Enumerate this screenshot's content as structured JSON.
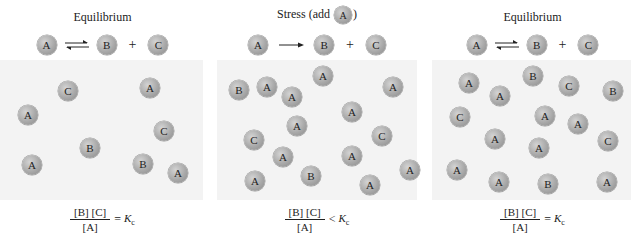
{
  "panels": [
    {
      "title": "Equilibrium",
      "reaction": {
        "reactant": "A",
        "arrow": "equilibrium",
        "products": [
          "B",
          "C"
        ],
        "plus": "+"
      },
      "molecules": [
        {
          "label": "C",
          "x": 58,
          "y": 21
        },
        {
          "label": "A",
          "x": 140,
          "y": 18
        },
        {
          "label": "A",
          "x": 18,
          "y": 45
        },
        {
          "label": "C",
          "x": 154,
          "y": 61
        },
        {
          "label": "B",
          "x": 80,
          "y": 78
        },
        {
          "label": "A",
          "x": 22,
          "y": 95
        },
        {
          "label": "B",
          "x": 133,
          "y": 94
        },
        {
          "label": "A",
          "x": 168,
          "y": 103
        }
      ],
      "formula": {
        "numerator": "[B] [C]",
        "denominator": "[A]",
        "relation": "=",
        "k": "K",
        "k_sub": "c"
      }
    },
    {
      "title_prefix": "Stress (add",
      "title_ball": "A",
      "title_suffix": ")",
      "reaction": {
        "reactant": "A",
        "arrow": "forward",
        "products": [
          "B",
          "C"
        ],
        "plus": "+"
      },
      "molecules": [
        {
          "label": "B",
          "x": 12,
          "y": 20
        },
        {
          "label": "A",
          "x": 40,
          "y": 17
        },
        {
          "label": "A",
          "x": 96,
          "y": 6
        },
        {
          "label": "A",
          "x": 65,
          "y": 27
        },
        {
          "label": "A",
          "x": 166,
          "y": 17
        },
        {
          "label": "A",
          "x": 125,
          "y": 42
        },
        {
          "label": "A",
          "x": 70,
          "y": 56
        },
        {
          "label": "C",
          "x": 27,
          "y": 70
        },
        {
          "label": "C",
          "x": 155,
          "y": 66
        },
        {
          "label": "A",
          "x": 56,
          "y": 87
        },
        {
          "label": "A",
          "x": 125,
          "y": 86
        },
        {
          "label": "A",
          "x": 183,
          "y": 100
        },
        {
          "label": "A",
          "x": 28,
          "y": 111
        },
        {
          "label": "B",
          "x": 84,
          "y": 106
        },
        {
          "label": "A",
          "x": 143,
          "y": 115
        }
      ],
      "formula": {
        "numerator": "[B] [C]",
        "denominator": "[A]",
        "relation": "<",
        "k": "K",
        "k_sub": "c"
      }
    },
    {
      "title": "Equilibrium",
      "reaction": {
        "reactant": "A",
        "arrow": "equilibrium",
        "products": [
          "B",
          "C"
        ],
        "plus": "+"
      },
      "molecules": [
        {
          "label": "A",
          "x": 27,
          "y": 13
        },
        {
          "label": "B",
          "x": 91,
          "y": 6
        },
        {
          "label": "C",
          "x": 127,
          "y": 16
        },
        {
          "label": "B",
          "x": 171,
          "y": 21
        },
        {
          "label": "A",
          "x": 58,
          "y": 26
        },
        {
          "label": "C",
          "x": 18,
          "y": 47
        },
        {
          "label": "A",
          "x": 103,
          "y": 46
        },
        {
          "label": "A",
          "x": 136,
          "y": 54
        },
        {
          "label": "A",
          "x": 53,
          "y": 69
        },
        {
          "label": "A",
          "x": 97,
          "y": 78
        },
        {
          "label": "C",
          "x": 166,
          "y": 71
        },
        {
          "label": "A",
          "x": 15,
          "y": 100
        },
        {
          "label": "A",
          "x": 57,
          "y": 112
        },
        {
          "label": "B",
          "x": 106,
          "y": 114
        },
        {
          "label": "A",
          "x": 165,
          "y": 112
        }
      ],
      "formula": {
        "numerator": "[B] [C]",
        "denominator": "[A]",
        "relation": "=",
        "k": "K",
        "k_sub": "c"
      }
    }
  ]
}
